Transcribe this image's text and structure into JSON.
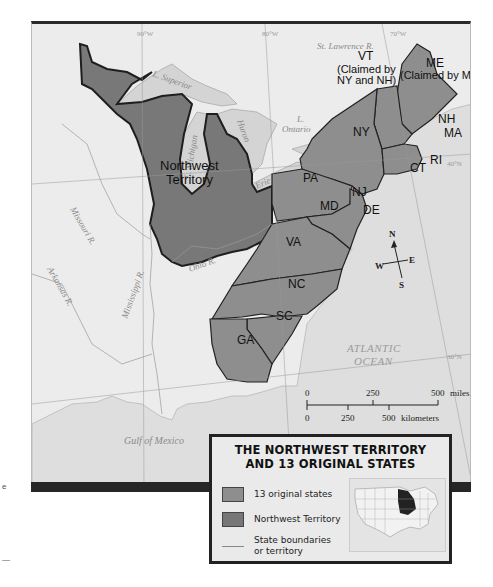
{
  "map": {
    "title_line1": "THE NORTHWEST TERRITORY",
    "title_line2": "AND 13 ORIGINAL STATES",
    "regions": {
      "northwest_territory": {
        "line1": "Northwest",
        "line2": "Territory"
      },
      "states": [
        "VT",
        "ME",
        "NH",
        "MA",
        "RI",
        "CT",
        "NY",
        "NJ",
        "PA",
        "DE",
        "MD",
        "VA",
        "NC",
        "SC",
        "GA"
      ],
      "vt_note_line1": "(Claimed by",
      "vt_note_line2": "NY and NH)",
      "me_note": "(Claimed by MA)"
    },
    "water_labels": {
      "superior": "L. Superior",
      "michigan": "L. Michigan",
      "huron": "Huron",
      "erie": "Erie",
      "ontario_line1": "L.",
      "ontario_line2": "Ontario",
      "st_lawrence": "St. Lawrence R.",
      "missouri": "Missouri R.",
      "arkansas": "Arkansas R.",
      "mississippi": "Mississippi R.",
      "ohio": "Ohio R.",
      "gulf": "Gulf of Mexico",
      "atlantic_line1": "ATLANTIC",
      "atlantic_line2": "OCEAN"
    },
    "grid_labels": {
      "lon90": "90°W",
      "lon80": "80°W",
      "lon70": "70°W",
      "lat40": "40°N",
      "lat30": "30°N"
    },
    "compass": {
      "n": "N",
      "s": "S",
      "e": "E",
      "w": "W"
    },
    "scale": {
      "miles_labels": [
        "0",
        "250",
        "500"
      ],
      "miles_unit": "miles",
      "km_labels": [
        "0",
        "250",
        "500"
      ],
      "km_unit": "kilometers"
    },
    "legend": {
      "items": [
        {
          "label": "13 original states",
          "color": "#8e8e8e"
        },
        {
          "label": "Northwest Territory",
          "color": "#777777"
        },
        {
          "label_line1": "State boundaries",
          "label_line2": "or territory"
        }
      ]
    },
    "colors": {
      "land": "#f0f0f0",
      "water": "#dcdcdc",
      "states": "#8e8e8e",
      "territory": "#787878",
      "border": "#222222"
    }
  }
}
